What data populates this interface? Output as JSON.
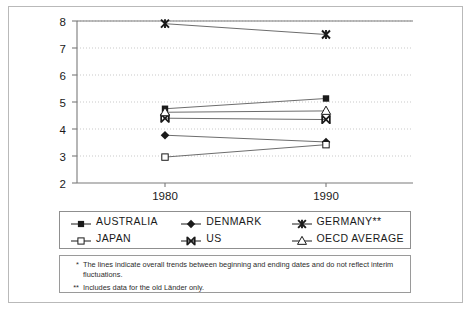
{
  "chart_data": {
    "type": "line",
    "title": "",
    "subtitle": "",
    "xlabel": "",
    "ylabel": "",
    "x": [
      1980,
      1990
    ],
    "categories": [
      "1980",
      "1990"
    ],
    "xticklabels": [
      "1980",
      "1990"
    ],
    "yticklabels": [
      "2",
      "3",
      "4",
      "5",
      "6",
      "7",
      "8"
    ],
    "yticks": [
      2,
      3,
      4,
      5,
      6,
      7,
      8
    ],
    "ylim": [
      2,
      8
    ],
    "grid": "horizontal-dotted",
    "legend_position": "below-plot",
    "series": [
      {
        "name": "AUSTRALIA",
        "marker": "filled-square",
        "values": [
          4.75,
          5.13
        ]
      },
      {
        "name": "DENMARK",
        "marker": "filled-diamond",
        "values": [
          3.77,
          3.52
        ]
      },
      {
        "name": "GERMANY**",
        "marker": "star",
        "values": [
          7.9,
          7.5
        ]
      },
      {
        "name": "JAPAN",
        "marker": "open-square",
        "values": [
          2.96,
          3.42
        ]
      },
      {
        "name": "US",
        "marker": "x-bar",
        "values": [
          4.4,
          4.35
        ]
      },
      {
        "name": "OECD AVERAGE",
        "marker": "open-triangle",
        "values": [
          4.62,
          4.67
        ]
      }
    ]
  },
  "legend": {
    "items": [
      {
        "label": "AUSTRALIA",
        "marker": "filled-square"
      },
      {
        "label": "DENMARK",
        "marker": "filled-diamond"
      },
      {
        "label": "GERMANY**",
        "marker": "star"
      },
      {
        "label": "JAPAN",
        "marker": "open-square"
      },
      {
        "label": "US",
        "marker": "x-bar"
      },
      {
        "label": "OECD AVERAGE",
        "marker": "open-triangle"
      }
    ]
  },
  "notes": [
    {
      "mark": "*",
      "text": "The lines indicate overall trends between beginning and ending dates and do not reflect interim fluctuations."
    },
    {
      "mark": "**",
      "text": "Includes data for the old Länder only."
    }
  ],
  "colors": {
    "ink": "#1a1a1a",
    "line": "#6d6d6d",
    "axis": "#7a7a7a",
    "grid": "#c9c9c9",
    "frame": "#b9b9b9"
  }
}
